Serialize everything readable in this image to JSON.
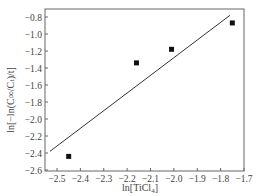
{
  "chart_data": {
    "type": "scatter",
    "title": "",
    "xlabel": "ln[TiCl4]",
    "xlabel_main": "ln[TiCl",
    "xlabel_sub": "4",
    "xlabel_close": "]",
    "ylabel": "ln[−ln(C∞/Cₜ)/t]",
    "xlim": [
      -2.55,
      -1.7
    ],
    "ylim": [
      -2.62,
      -0.7
    ],
    "xticks": [
      -2.5,
      -2.4,
      -2.3,
      -2.2,
      -2.1,
      -2.0,
      -1.9,
      -1.8,
      -1.7
    ],
    "xtick_labels": [
      "−2.5",
      "−2.4",
      "−2.3",
      "−2.2",
      "−2.1",
      "−2.0",
      "−1.9",
      "−1.8",
      "−1.7"
    ],
    "yticks": [
      -0.8,
      -1.0,
      -1.2,
      -1.4,
      -1.6,
      -1.8,
      -2.0,
      -2.2,
      -2.4,
      -2.6
    ],
    "ytick_labels": [
      "−0.8",
      "−1.0",
      "−1.2",
      "−1.4",
      "−1.6",
      "−1.8",
      "−2.0",
      "−2.2",
      "−2.4",
      "−2.6"
    ],
    "grid": false,
    "legend": null,
    "series": [
      {
        "name": "data",
        "marker": "square",
        "color": "#111111",
        "x": [
          -2.45,
          -2.16,
          -2.01,
          -1.75
        ],
        "y": [
          -2.44,
          -1.34,
          -1.18,
          -0.87
        ]
      },
      {
        "name": "linear fit",
        "type": "line",
        "color": "#333333",
        "x": [
          -2.53,
          -1.76
        ],
        "y": [
          -2.38,
          -0.78
        ]
      }
    ]
  }
}
